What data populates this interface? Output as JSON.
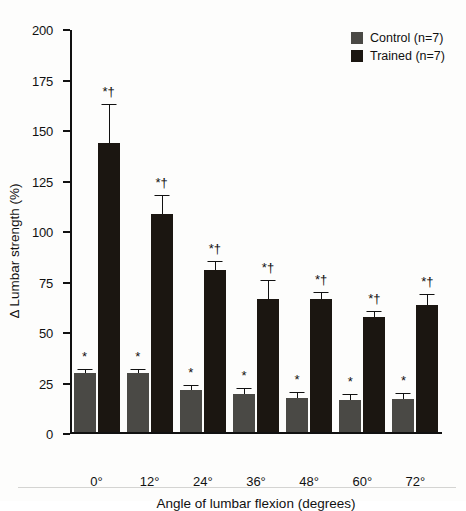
{
  "chart_data": {
    "type": "bar",
    "title": "",
    "xlabel": "Angle of lumbar flexion (degrees)",
    "ylabel": "Δ Lumbar strength (%)",
    "categories": [
      "0°",
      "12°",
      "24°",
      "36°",
      "48°",
      "60°",
      "72°"
    ],
    "ylim": [
      0,
      200
    ],
    "yticks": [
      0,
      25,
      50,
      75,
      100,
      125,
      150,
      175,
      200
    ],
    "ytick_labels": [
      "0",
      "25",
      "50",
      "75",
      "100",
      "125",
      "150",
      "175",
      "200"
    ],
    "grid": false,
    "legend_position": "top-right",
    "series": [
      {
        "name": "Control (n=7)",
        "color": "#4a4945",
        "values": [
          29,
          29,
          21,
          19,
          17,
          16,
          16.5
        ],
        "errors": [
          1.5,
          1.5,
          2,
          2.5,
          2.5,
          2.5,
          2.5
        ],
        "annotations": [
          "*",
          "*",
          "*",
          "*",
          "*",
          "*",
          "*"
        ]
      },
      {
        "name": "Trained (n=7)",
        "color": "#1b1611",
        "values": [
          143,
          108,
          80,
          66,
          66,
          57,
          63
        ],
        "errors": [
          19,
          9,
          4,
          9,
          3,
          2.5,
          5
        ],
        "annotations": [
          "*†",
          "*†",
          "*†",
          "*†",
          "*†",
          "*†",
          "*†"
        ]
      }
    ]
  },
  "legend": {
    "items": [
      {
        "label": "Control (n=7)",
        "color": "#4a4945"
      },
      {
        "label": "Trained (n=7)",
        "color": "#1b1611"
      }
    ]
  },
  "axes": {
    "y_title": "Δ Lumbar strength (%)",
    "x_title": "Angle of lumbar flexion (degrees)"
  }
}
